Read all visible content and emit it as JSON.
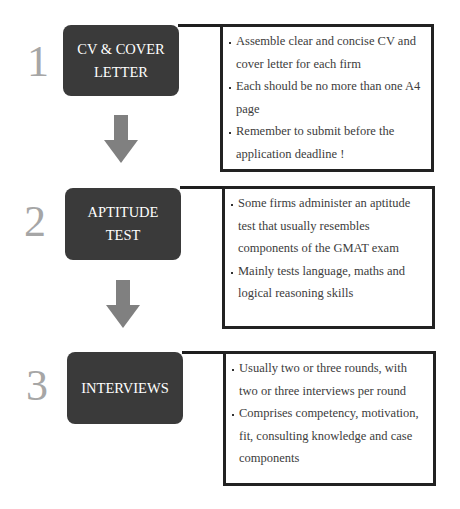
{
  "steps": [
    {
      "number": "1",
      "title_lines": [
        "CV & COVER",
        "LETTER"
      ],
      "bullets": [
        "Assemble clear and concise CV and cover letter for each firm",
        "Each should be no more than one A4 page",
        "Remember to submit before the application deadline !"
      ]
    },
    {
      "number": "2",
      "title_lines": [
        "APTITUDE",
        "TEST"
      ],
      "bullets": [
        "Some firms administer an aptitude test that usually resembles components of the GMAT exam",
        "Mainly tests language, maths and logical reasoning skills"
      ]
    },
    {
      "number": "3",
      "title_lines": [
        "INTERVIEWS"
      ],
      "bullets": [
        "Usually two or three rounds, with two or three interviews per round",
        "Comprises competency, motivation, fit, consulting knowledge and case components"
      ]
    }
  ],
  "colors": {
    "step_box": "#3a3a3a",
    "step_number": "#a6a6a6",
    "arrow": "#808080",
    "border": "#222222"
  },
  "arrows": [
    "down-arrow-1-to-2",
    "down-arrow-2-to-3"
  ]
}
